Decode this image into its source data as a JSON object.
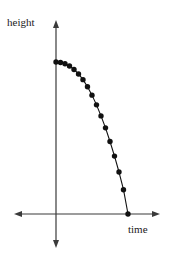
{
  "figure": {
    "background": "#ffffff",
    "ink_color": "#111111",
    "axis_color": "#3a3a3a"
  },
  "chart_data": {
    "type": "scatter",
    "title": "",
    "subtitle": "",
    "xlabel": "time",
    "ylabel": "height",
    "legend": [],
    "grid": false,
    "axes_style": "double-arrow-cross",
    "origin": {
      "x": 0,
      "y": 0
    },
    "xlim": [
      -1.05,
      4.3
    ],
    "ylim": [
      -1.2,
      2.35
    ],
    "marker": "filled-circle",
    "marker_color": "#111111",
    "line_color": "#111111",
    "annotations": [],
    "x": [
      0.0,
      0.18,
      0.36,
      0.54,
      0.72,
      0.9,
      1.08,
      1.26,
      1.44,
      1.62,
      1.8,
      1.98,
      2.16,
      2.34,
      2.52,
      2.7,
      2.88
    ],
    "values": [
      1.72,
      1.715,
      1.7,
      1.675,
      1.635,
      1.585,
      1.52,
      1.44,
      1.345,
      1.235,
      1.11,
      0.975,
      0.82,
      0.655,
      0.475,
      0.275,
      0.0
    ],
    "pixel_geometry": {
      "x_axis_y": 214,
      "y_axis_x": 56,
      "x_axis_left_tip": 14,
      "x_axis_right_tip": 160,
      "y_axis_top_tip": 20,
      "y_axis_bottom_tip": 248,
      "curve_start": [
        56,
        62
      ],
      "curve_end": [
        128,
        214
      ],
      "marker_radius": 2.7,
      "line_width": 1.1
    }
  }
}
